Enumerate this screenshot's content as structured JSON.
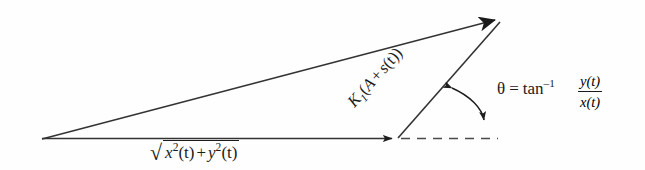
{
  "figure": {
    "type": "vector-diagram",
    "background_color": "#fefefe",
    "stroke_color": "#2a2a2a",
    "labels": {
      "magnitude": {
        "radical": "√",
        "x_base": "x",
        "x_exp": "2",
        "x_arg": "(t)",
        "plus": "+",
        "y_base": "y",
        "y_exp": "2",
        "y_arg": "(t)",
        "plain": "√(x²(t) + y²(t))"
      },
      "diagonal": {
        "k": "K",
        "k_sub": "1",
        "open_paren": "(",
        "a": "A",
        "plus": "+",
        "s": "s",
        "s_arg": "(t)",
        "close_paren": ")",
        "plain": "K₁(A + s(t))"
      },
      "theta": {
        "symbol": "θ",
        "equals": "=",
        "function": "tan",
        "exponent": "–1",
        "numerator": "y(t)",
        "denominator": "x(t)",
        "plain": "θ = tan⁻¹ y(t)/x(t)"
      }
    },
    "geometry": {
      "origin": [
        42,
        139
      ],
      "horizontal_tip": [
        398,
        138
      ],
      "resultant_tip": [
        505,
        15
      ],
      "dashed_end": [
        498,
        138
      ],
      "arc_start": [
        448,
        86
      ],
      "arc_end": [
        483,
        124
      ]
    }
  }
}
